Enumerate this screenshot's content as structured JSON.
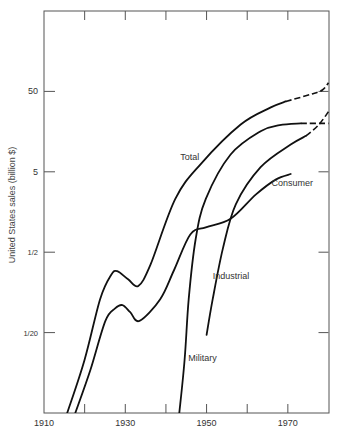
{
  "chart_data": {
    "type": "line",
    "title": "",
    "xlabel": "",
    "ylabel": "United States sales (billion $)",
    "xlim": [
      1910,
      1980
    ],
    "ylim": [
      0.005,
      500
    ],
    "yscale": "log",
    "grid": false,
    "legend": "none (inline labels)",
    "x_ticks": [
      1910,
      1920,
      1930,
      1940,
      1950,
      1960,
      1970,
      1980
    ],
    "x_tick_labels": [
      {
        "value": 1910,
        "label": "1910"
      },
      {
        "value": 1930,
        "label": "1930"
      },
      {
        "value": 1950,
        "label": "1950"
      },
      {
        "value": 1970,
        "label": "1970"
      }
    ],
    "y_tick_labels": [
      {
        "value": 50,
        "label": "50"
      },
      {
        "value": 5,
        "label": "5"
      },
      {
        "value": 0.5,
        "label": "1/2"
      },
      {
        "value": 0.05,
        "label": "1/20"
      }
    ],
    "series": [
      {
        "name": "Total",
        "label": "Total",
        "label_anchor": {
          "x": 1943.5,
          "y": 7.0
        },
        "points": [
          [
            1915.7,
            0.005
          ],
          [
            1920,
            0.023
          ],
          [
            1923.8,
            0.13
          ],
          [
            1926.5,
            0.26
          ],
          [
            1928,
            0.29
          ],
          [
            1930.7,
            0.23
          ],
          [
            1933.2,
            0.19
          ],
          [
            1936.2,
            0.35
          ],
          [
            1942.3,
            2.3
          ],
          [
            1948.5,
            6.2
          ],
          [
            1958.4,
            19.4
          ],
          [
            1965.8,
            31.6
          ],
          [
            1969.5,
            37.5
          ]
        ],
        "projected": [
          [
            1969.5,
            37.5
          ],
          [
            1975.7,
            46
          ],
          [
            1978.5,
            52
          ],
          [
            1980,
            64
          ]
        ]
      },
      {
        "name": "Military",
        "label": "Military",
        "label_anchor": {
          "x": 1945.5,
          "y": 0.022
        },
        "points": [
          [
            1943.3,
            0.005
          ],
          [
            1944.6,
            0.023
          ],
          [
            1945.6,
            0.13
          ],
          [
            1947.3,
            0.72
          ],
          [
            1949.8,
            2.3
          ],
          [
            1955.9,
            8.2
          ],
          [
            1963.3,
            16
          ],
          [
            1968,
            19
          ],
          [
            1973.2,
            20
          ]
        ],
        "projected": [
          [
            1973.2,
            20
          ],
          [
            1980,
            20
          ]
        ]
      },
      {
        "name": "Industrial",
        "label": "Industrial",
        "label_anchor": {
          "x": 1951.5,
          "y": 0.23
        },
        "points": [
          [
            1950,
            0.047
          ],
          [
            1951.5,
            0.13
          ],
          [
            1954,
            0.55
          ],
          [
            1957.2,
            1.97
          ],
          [
            1963.3,
            5.7
          ],
          [
            1970.7,
            10.9
          ],
          [
            1974.5,
            14
          ]
        ],
        "projected": [
          [
            1974.5,
            14
          ],
          [
            1977.5,
            19
          ],
          [
            1980,
            28
          ]
        ]
      },
      {
        "name": "Consumer",
        "label": "Consumer",
        "label_anchor": {
          "x": 1966,
          "y": 3.3
        },
        "points": [
          [
            1917.7,
            0.005
          ],
          [
            1921.4,
            0.017
          ],
          [
            1925.1,
            0.07
          ],
          [
            1927.5,
            0.1
          ],
          [
            1929.3,
            0.11
          ],
          [
            1931.2,
            0.09
          ],
          [
            1933.5,
            0.07
          ],
          [
            1938.6,
            0.13
          ],
          [
            1942,
            0.3
          ],
          [
            1946,
            0.83
          ],
          [
            1949.8,
            1.02
          ],
          [
            1955.9,
            1.3
          ],
          [
            1962.1,
            2.6
          ],
          [
            1967,
            4.0
          ],
          [
            1970.7,
            4.7
          ]
        ],
        "projected": []
      }
    ]
  }
}
